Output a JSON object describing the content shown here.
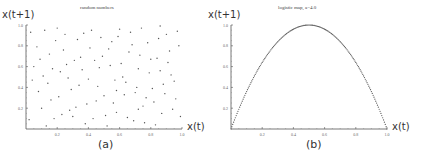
{
  "chart_data": [
    {
      "type": "scatter",
      "panel": "(a)",
      "title": "random numbers",
      "xlabel": "x(t)",
      "ylabel": "x(t+1)",
      "xlim": [
        0,
        1
      ],
      "ylim": [
        0,
        1
      ],
      "xticks": [
        "0.2",
        "0.4",
        "0.6",
        "0.8",
        "1.0"
      ],
      "yticks": [
        "0.2",
        "0.4",
        "0.6",
        "0.8",
        "1.0"
      ],
      "grid": false,
      "points": [
        [
          0.03,
          0.93
        ],
        [
          0.08,
          0.36
        ],
        [
          0.12,
          0.95
        ],
        [
          0.15,
          0.72
        ],
        [
          0.19,
          0.85
        ],
        [
          0.22,
          0.55
        ],
        [
          0.25,
          0.91
        ],
        [
          0.28,
          0.18
        ],
        [
          0.31,
          0.66
        ],
        [
          0.34,
          0.42
        ],
        [
          0.38,
          0.05
        ],
        [
          0.41,
          0.78
        ],
        [
          0.45,
          0.27
        ],
        [
          0.48,
          0.88
        ],
        [
          0.51,
          0.13
        ],
        [
          0.54,
          0.61
        ],
        [
          0.57,
          0.47
        ],
        [
          0.6,
          0.96
        ],
        [
          0.63,
          0.33
        ],
        [
          0.66,
          0.74
        ],
        [
          0.69,
          0.08
        ],
        [
          0.72,
          0.58
        ],
        [
          0.75,
          0.22
        ],
        [
          0.78,
          0.83
        ],
        [
          0.81,
          0.39
        ],
        [
          0.84,
          0.68
        ],
        [
          0.87,
          0.15
        ],
        [
          0.9,
          0.91
        ],
        [
          0.93,
          0.52
        ],
        [
          0.96,
          0.29
        ],
        [
          0.98,
          0.8
        ],
        [
          0.05,
          0.6
        ],
        [
          0.1,
          0.2
        ],
        [
          0.14,
          0.44
        ],
        [
          0.18,
          0.1
        ],
        [
          0.21,
          0.31
        ],
        [
          0.24,
          0.76
        ],
        [
          0.27,
          0.49
        ],
        [
          0.3,
          0.12
        ],
        [
          0.33,
          0.86
        ],
        [
          0.36,
          0.57
        ],
        [
          0.39,
          0.24
        ],
        [
          0.42,
          0.95
        ],
        [
          0.46,
          0.41
        ],
        [
          0.49,
          0.7
        ],
        [
          0.52,
          0.03
        ],
        [
          0.55,
          0.84
        ],
        [
          0.58,
          0.16
        ],
        [
          0.61,
          0.63
        ],
        [
          0.64,
          0.45
        ],
        [
          0.67,
          0.93
        ],
        [
          0.7,
          0.35
        ],
        [
          0.73,
          0.71
        ],
        [
          0.76,
          0.06
        ],
        [
          0.79,
          0.54
        ],
        [
          0.82,
          0.26
        ],
        [
          0.85,
          0.87
        ],
        [
          0.88,
          0.43
        ],
        [
          0.91,
          0.64
        ],
        [
          0.94,
          0.19
        ],
        [
          0.97,
          0.94
        ],
        [
          0.02,
          0.09
        ],
        [
          0.07,
          0.79
        ],
        [
          0.11,
          0.51
        ],
        [
          0.16,
          0.28
        ],
        [
          0.2,
          0.97
        ],
        [
          0.23,
          0.14
        ],
        [
          0.26,
          0.62
        ],
        [
          0.29,
          0.38
        ],
        [
          0.32,
          0.21
        ],
        [
          0.35,
          0.69
        ],
        [
          0.37,
          0.92
        ],
        [
          0.4,
          0.48
        ],
        [
          0.43,
          0.1
        ],
        [
          0.47,
          0.59
        ],
        [
          0.5,
          0.32
        ],
        [
          0.53,
          0.77
        ],
        [
          0.56,
          0.25
        ],
        [
          0.59,
          0.89
        ],
        [
          0.62,
          0.5
        ],
        [
          0.65,
          0.11
        ],
        [
          0.68,
          0.81
        ],
        [
          0.71,
          0.4
        ],
        [
          0.74,
          0.97
        ],
        [
          0.77,
          0.3
        ],
        [
          0.8,
          0.67
        ],
        [
          0.83,
          0.04
        ],
        [
          0.86,
          0.56
        ],
        [
          0.89,
          0.34
        ],
        [
          0.92,
          0.75
        ],
        [
          0.95,
          0.46
        ],
        [
          0.99,
          0.12
        ],
        [
          0.04,
          0.47
        ],
        [
          0.09,
          0.67
        ],
        [
          0.13,
          0.03
        ],
        [
          0.17,
          0.58
        ],
        [
          0.44,
          0.66
        ],
        [
          0.58,
          0.37
        ],
        [
          0.72,
          0.19
        ],
        [
          0.86,
          0.99
        ]
      ]
    },
    {
      "type": "scatter",
      "panel": "(b)",
      "title": "logistic map, a=4.0",
      "xlabel": "x(t)",
      "ylabel": "x(t+1)",
      "xlim": [
        0,
        1
      ],
      "ylim": [
        0,
        1
      ],
      "xticks": [
        "0.2",
        "0.4",
        "0.6",
        "0.8",
        "1.0"
      ],
      "yticks": [
        "0.2",
        "0.4",
        "0.6",
        "0.8",
        "1.0"
      ],
      "grid": false,
      "function": "x(t+1) = 4.0 * x(t) * (1 - x(t))",
      "points_description": "points lying on the parabola x(t+1)=4x(t)(1-x(t)), peak 1.0 at x(t)=0.5"
    }
  ],
  "panels": {
    "a": {
      "title": "random numbers",
      "ylabel": "x(t+1)",
      "xlabel": "x(t)",
      "caption": "(a)"
    },
    "b": {
      "title": "logistic map, a=4.0",
      "ylabel": "x(t+1)",
      "xlabel": "x(t)",
      "caption": "(b)"
    }
  },
  "ticks": {
    "x": [
      "0.2",
      "0.4",
      "0.6",
      "0.8",
      "1.0"
    ],
    "y": [
      "0.2",
      "0.4",
      "0.6",
      "0.8",
      "1.0"
    ]
  }
}
